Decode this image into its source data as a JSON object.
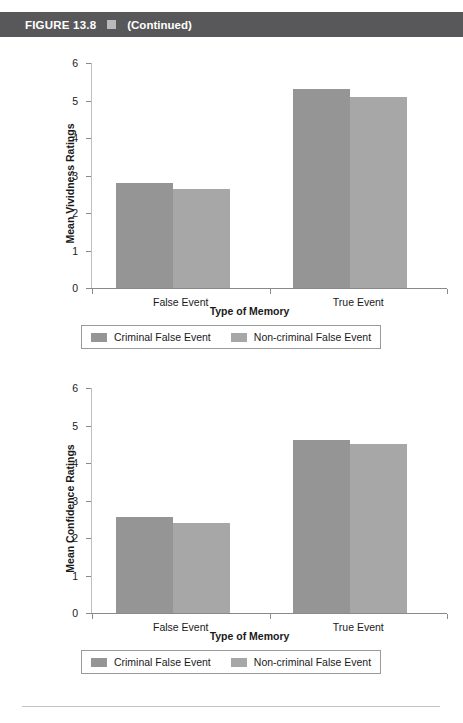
{
  "figure_header": {
    "label": "FIGURE 13.8",
    "separator_icon": "square-bullet-icon",
    "continued": "(Continued)",
    "bar_color": "#58585a",
    "text_color": "#ffffff"
  },
  "colors": {
    "series_criminal": "#959595",
    "series_noncriminal": "#a7a7a7",
    "axis": "#8a8a8a",
    "text": "#1a1a1a",
    "footer_rule": "#c2c2c2"
  },
  "legend": {
    "items": [
      {
        "label": "Criminal False Event",
        "swatch": "dark"
      },
      {
        "label": "Non-criminal False Event",
        "swatch": "light"
      }
    ]
  },
  "chart_data": [
    {
      "id": "vividness",
      "type": "bar",
      "title": "",
      "xlabel": "Type of Memory",
      "ylabel": "Mean Vividness Ratings",
      "categories": [
        "False Event",
        "True Event"
      ],
      "yticks": [
        0,
        1,
        2,
        3,
        4,
        5,
        6
      ],
      "ylim": [
        0,
        6
      ],
      "grid": false,
      "legend_position": "bottom",
      "series": [
        {
          "name": "Criminal False Event",
          "values": [
            2.8,
            5.3
          ]
        },
        {
          "name": "Non-criminal False Event",
          "values": [
            2.65,
            5.1
          ]
        }
      ]
    },
    {
      "id": "confidence",
      "type": "bar",
      "title": "",
      "xlabel": "Type of Memory",
      "ylabel": "Mean Confidence Ratings",
      "categories": [
        "False Event",
        "True Event"
      ],
      "yticks": [
        0,
        1,
        2,
        3,
        4,
        5,
        6
      ],
      "ylim": [
        0,
        6
      ],
      "grid": false,
      "legend_position": "bottom",
      "series": [
        {
          "name": "Criminal False Event",
          "values": [
            2.55,
            4.62
          ]
        },
        {
          "name": "Non-criminal False Event",
          "values": [
            2.4,
            4.5
          ]
        }
      ]
    }
  ]
}
